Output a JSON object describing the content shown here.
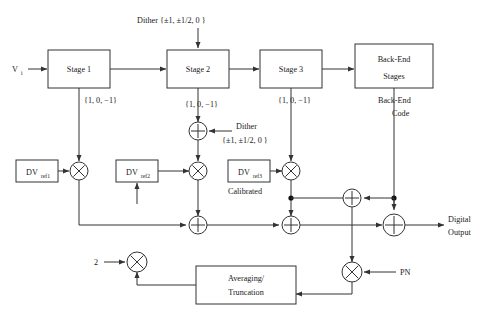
{
  "figure": {
    "type": "block-diagram",
    "top_caption_fragment": ""
  },
  "signals": {
    "input_label": "V",
    "input_sub": "i",
    "output_line1": "Digital",
    "output_line2": "Output",
    "pn_label": "PN",
    "gain_two": "2"
  },
  "dither": {
    "top_label": "Dither {±1, ±1/2, 0 }",
    "mid_label": "Dither",
    "mid_values": "{±1, ±1/2, 0 }"
  },
  "stages": [
    {
      "label": "Stage 1",
      "code": "{1, 0, −1}"
    },
    {
      "label": "Stage 2",
      "code": "{1, 0, −1}"
    },
    {
      "label": "Stage 3",
      "code": "{1, 0, −1}"
    }
  ],
  "backend": {
    "line1": "Back-End",
    "line2": "Stages",
    "code_line1": "Back-End",
    "code_line2": "Code"
  },
  "refs": [
    {
      "name": "DV",
      "sub": "ref1",
      "note": ""
    },
    {
      "name": "DV",
      "sub": "ref2",
      "note": ""
    },
    {
      "name": "DV",
      "sub": "ref3",
      "note": "Calibrated"
    }
  ],
  "averaging": {
    "line1": "Averaging/",
    "line2": "Truncation"
  },
  "operators": {
    "multiply_glyph": "×",
    "add_glyph": "+"
  },
  "colors": {
    "stroke": "#333333",
    "background": "#ffffff",
    "text": "#1a1a1a"
  }
}
